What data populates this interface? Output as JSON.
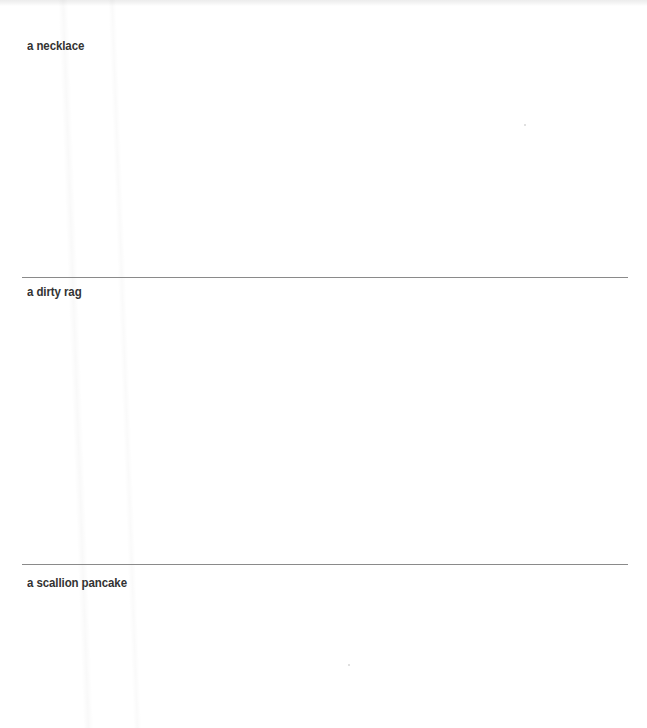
{
  "document": {
    "sections": [
      {
        "label": "a necklace"
      },
      {
        "label": "a dirty rag"
      },
      {
        "label": "a scallion pancake"
      }
    ]
  }
}
